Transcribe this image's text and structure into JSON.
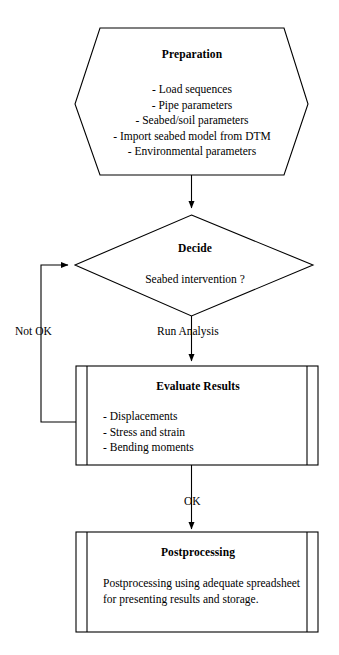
{
  "diagram": {
    "type": "flowchart",
    "nodes": {
      "preparation": {
        "shape": "hexagon",
        "title": "Preparation",
        "items": [
          "- Load sequences",
          "- Pipe parameters",
          "- Seabed/soil parameters",
          "- Import seabed model from DTM",
          "- Environmental parameters"
        ]
      },
      "decide": {
        "shape": "diamond",
        "title": "Decide",
        "question": "Seabed  intervention ?"
      },
      "evaluate": {
        "shape": "predefined-process",
        "title": "Evaluate Results",
        "items": [
          "- Displacements",
          "- Stress and strain",
          "- Bending moments"
        ]
      },
      "postprocessing": {
        "shape": "predefined-process",
        "title": "Postprocessing",
        "body": "Postprocessing using adequate spreadsheet for presenting results and storage."
      }
    },
    "edges": {
      "prep_to_decide": {
        "label": ""
      },
      "decide_to_evaluate": {
        "label": "Run Analysis"
      },
      "evaluate_to_decide": {
        "label": "Not OK"
      },
      "evaluate_to_postprocessing": {
        "label": "OK"
      }
    },
    "colors": {
      "stroke": "#000000",
      "background": "#ffffff",
      "text": "#000000"
    }
  }
}
